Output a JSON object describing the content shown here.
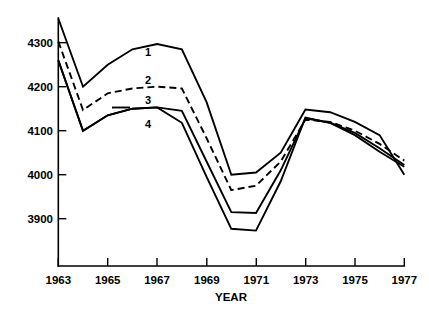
{
  "chart_data": {
    "type": "line",
    "title": "",
    "xlabel": "YEAR",
    "ylabel": "",
    "x": [
      1963,
      1964,
      1965,
      1966,
      1967,
      1968,
      1969,
      1970,
      1971,
      1972,
      1973,
      1974,
      1975,
      1976,
      1977
    ],
    "xlim": [
      1963,
      1977
    ],
    "ylim": [
      3850,
      4360
    ],
    "xticks": [
      1963,
      1965,
      1967,
      1969,
      1971,
      1973,
      1975,
      1977
    ],
    "xtick_labels": [
      "1963",
      "1965",
      "1967",
      "1969",
      "1971",
      "1973",
      "1975",
      "1977"
    ],
    "yticks": [
      3900,
      4000,
      4100,
      4200,
      4300
    ],
    "ytick_labels": [
      "3900",
      "4000",
      "4100",
      "4200",
      "4300"
    ],
    "grid": false,
    "legend_position": "inline-labels",
    "series": [
      {
        "name": "1",
        "label": "1",
        "style": "solid",
        "values": [
          4355,
          4200,
          4250,
          4285,
          4297,
          4285,
          4165,
          4000,
          4005,
          4050,
          4148,
          4142,
          4120,
          4090,
          4000
        ]
      },
      {
        "name": "2",
        "label": "2",
        "style": "dashed",
        "values": [
          4303,
          4147,
          4185,
          4196,
          4200,
          4196,
          4083,
          3965,
          3975,
          4030,
          4125,
          4120,
          4100,
          4070,
          4032
        ]
      },
      {
        "name": "3",
        "label": "3",
        "style": "solid",
        "values": [
          4260,
          4100,
          4135,
          4150,
          4153,
          4145,
          4030,
          3915,
          3913,
          4010,
          4128,
          4118,
          4095,
          4060,
          4022
        ]
      },
      {
        "name": "4",
        "label": "4",
        "style": "solid",
        "values": [
          4260,
          4100,
          4135,
          4150,
          4153,
          4118,
          3995,
          3877,
          3873,
          3985,
          4130,
          4118,
          4090,
          4052,
          4018
        ]
      }
    ]
  },
  "axis": {
    "y_tick_labels": [
      "4300",
      "4200",
      "4100",
      "4000",
      "3900"
    ],
    "x_tick_labels": [
      "1963",
      "1965",
      "1967",
      "1969",
      "1971",
      "1973",
      "1975",
      "1977"
    ],
    "x_axis_title": "YEAR"
  },
  "series_labels": [
    {
      "text": "1"
    },
    {
      "text": "2"
    },
    {
      "text": "3"
    },
    {
      "text": "4"
    }
  ]
}
